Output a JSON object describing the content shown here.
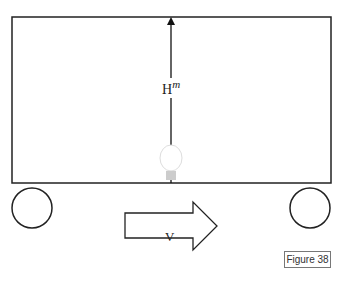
{
  "diagram": {
    "height_label": "H",
    "height_superscript": "m",
    "velocity_label": "V",
    "figure_caption": "Figure 38",
    "elements": [
      "rectangular-box",
      "vertical-arrow",
      "light-bulb",
      "left-wheel",
      "right-wheel",
      "velocity-arrow"
    ],
    "colors": {
      "stroke": "#222222",
      "bulb": "#cccccc"
    }
  }
}
